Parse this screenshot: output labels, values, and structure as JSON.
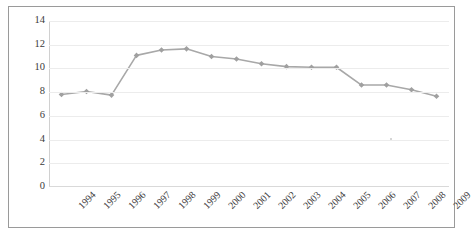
{
  "chart_data": {
    "type": "line",
    "title": "",
    "subtitle": "",
    "xlabel": "",
    "ylabel": "",
    "categories": [
      "1994",
      "1995",
      "1996",
      "1997",
      "1998",
      "1999",
      "2000",
      "2001",
      "2002",
      "2003",
      "2004",
      "2005",
      "2006",
      "2007",
      "2008",
      "2009"
    ],
    "values": [
      7.8,
      8.05,
      7.75,
      11.1,
      11.55,
      11.65,
      11.0,
      10.8,
      10.4,
      10.15,
      10.1,
      10.1,
      8.6,
      8.6,
      8.2,
      7.65
    ],
    "series": [
      {
        "name": "",
        "values": [
          7.8,
          8.05,
          7.75,
          11.1,
          11.55,
          11.65,
          11.0,
          10.8,
          10.4,
          10.15,
          10.1,
          10.1,
          8.6,
          8.6,
          8.2,
          7.65
        ]
      }
    ],
    "ylim": [
      0,
      14
    ],
    "yticks": [
      0,
      2,
      4,
      6,
      8,
      10,
      12,
      14
    ],
    "ytick_labels": [
      "0",
      "2",
      "4",
      "6",
      "8",
      "10",
      "12",
      "14"
    ],
    "grid": true,
    "grid_axis": "y",
    "legend": false,
    "legend_position": "none",
    "marker": "diamond",
    "line_color": "#a8a8a8",
    "marker_color": "#a0a0a0",
    "grid_color": "#ececec",
    "border_color": "#9a9a9a",
    "background_color": "#ffffff",
    "text_color": "#3b3b3b",
    "xtick_rotation": -45
  }
}
